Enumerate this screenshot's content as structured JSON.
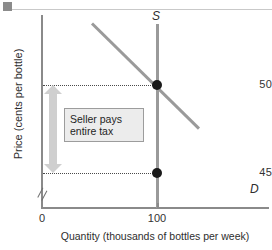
{
  "figure": {
    "background": "#ffffff",
    "accent_gray": "#9a9a9a",
    "arrow_color": "#cfcfcf",
    "dot_color": "#1a1a1a"
  },
  "annotation": {
    "line1": "Seller pays",
    "line2": "entire tax"
  },
  "chart_data": {
    "type": "line",
    "title": "",
    "xlabel": "Quantity (thousands of bottles per week)",
    "ylabel": "Price (cents per bottle)",
    "xlim": [
      0,
      175
    ],
    "ylim": [
      44,
      56
    ],
    "grid": false,
    "y_axis_break": true,
    "xticks": [
      "0",
      "100"
    ],
    "yticks": [
      "50",
      "45"
    ],
    "series": [
      {
        "name": "S",
        "label": "S",
        "type": "supply",
        "shape": "vertical",
        "x": [
          100,
          100
        ],
        "y": [
          44,
          56
        ],
        "color": "#9a9a9a"
      },
      {
        "name": "D",
        "label": "D",
        "type": "demand",
        "shape": "downward-sloping",
        "x": [
          55,
          165
        ],
        "y": [
          55.5,
          44.6
        ],
        "color": "#9a9a9a"
      }
    ],
    "points": [
      {
        "name": "equilibrium-before-tax",
        "x": 100,
        "y": 50,
        "label": "50"
      },
      {
        "name": "price-received-by-seller",
        "x": 100,
        "y": 45,
        "label": "45"
      }
    ],
    "annotations": [
      {
        "name": "seller-pays-entire-tax",
        "text": "Seller pays entire tax",
        "from_y": 50,
        "to_y": 45,
        "arrow": "double-headed-vertical"
      }
    ],
    "guides": [
      {
        "name": "price-guide-50",
        "y": 50,
        "style": "dotted"
      },
      {
        "name": "price-guide-45",
        "y": 45,
        "style": "dotted"
      }
    ]
  }
}
